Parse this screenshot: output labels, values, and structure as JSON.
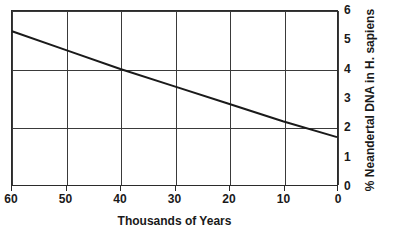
{
  "chart_data": {
    "type": "line",
    "title": "",
    "xlabel": "Thousands of Years",
    "ylabel": "% Neandertal DNA in H. sapiens",
    "x": [
      60,
      50,
      40,
      30,
      20,
      10,
      0
    ],
    "xtick_labels": [
      "60",
      "50",
      "40",
      "30",
      "20",
      "10",
      "0"
    ],
    "xlim": [
      60,
      0
    ],
    "x_axis_reversed": true,
    "ytick_labels": [
      "0",
      "1",
      "2",
      "3",
      "4",
      "5",
      "6"
    ],
    "ytick_values": [
      0,
      1,
      2,
      3,
      4,
      5,
      6
    ],
    "ylim": [
      0,
      6
    ],
    "grid": {
      "vertical_at": [
        60,
        50,
        40,
        30,
        20,
        10,
        0
      ],
      "horizontal_at": [
        2,
        4,
        6
      ],
      "enabled": true
    },
    "legend": null,
    "series": [
      {
        "name": "% Neandertal DNA in H. sapiens",
        "color": "#1a1a1a",
        "line_width": 2,
        "points": [
          {
            "x": 60,
            "y": 5.3
          },
          {
            "x": 50,
            "y": 4.65
          },
          {
            "x": 40,
            "y": 4.0
          },
          {
            "x": 30,
            "y": 3.4
          },
          {
            "x": 20,
            "y": 2.8
          },
          {
            "x": 10,
            "y": 2.2
          },
          {
            "x": 0,
            "y": 1.65
          }
        ],
        "values": [
          5.3,
          4.65,
          4.0,
          3.4,
          2.8,
          2.2,
          1.65
        ]
      }
    ]
  },
  "colors": {
    "axis": "#2b2b2b",
    "grid": "#3a3a3a",
    "line": "#1a1a1a",
    "background": "#ffffff",
    "text": "#1a1a1a"
  }
}
